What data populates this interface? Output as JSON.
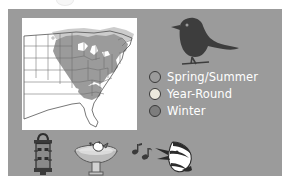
{
  "slide": {
    "background_color": "#ffffff",
    "panel_color": "#9b9b9b"
  },
  "map": {
    "title": "eastern-north-america-range-map",
    "background_color": "#ffffff",
    "outline_color": "#555555",
    "range_shading_color": "#9b9b9b",
    "secondary_shading_color": "#c4c4c4"
  },
  "bird": {
    "name": "perched-songbird-silhouette",
    "color": "#3c3c3c"
  },
  "legend": {
    "items": [
      {
        "label": "Spring/Summer",
        "color": "#9b9b9b",
        "swatch": "spring-summer-swatch"
      },
      {
        "label": "Year-Round",
        "color": "#ece9dd",
        "swatch": "year-round-swatch"
      },
      {
        "label": "Winter",
        "color": "#7d7d7d",
        "swatch": "winter-swatch"
      }
    ],
    "text_color": "#ffffff"
  },
  "icons": [
    {
      "name": "bird-feeder-icon",
      "label": "Bird Feeder"
    },
    {
      "name": "bird-bath-icon",
      "label": "Bird Bath"
    },
    {
      "name": "singing-bird-icon",
      "label": "Bird Song"
    }
  ]
}
